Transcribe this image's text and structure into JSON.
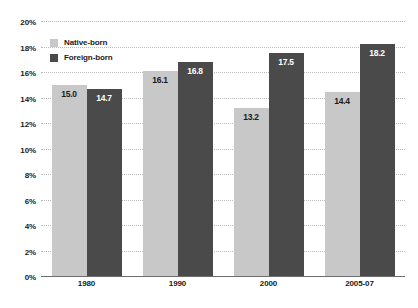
{
  "chart_data": {
    "type": "bar",
    "title": "",
    "xlabel": "",
    "ylabel": "",
    "categories": [
      "1980",
      "1990",
      "2000",
      "2005-07"
    ],
    "series": [
      {
        "name": "Native-born",
        "color": "#c8c8c8",
        "values": [
          15.0,
          16.1,
          13.2,
          14.4
        ],
        "labels": [
          "15.0",
          "16.1",
          "13.2",
          "14.4"
        ]
      },
      {
        "name": "Foreign-born",
        "color": "#4a4a4a",
        "values": [
          14.7,
          16.8,
          17.5,
          18.2
        ],
        "labels": [
          "14.7",
          "16.8",
          "17.5",
          "18.2"
        ]
      }
    ],
    "ylim": [
      0,
      20
    ],
    "ytick_step": 2,
    "ytick_labels": [
      "20%",
      "18%",
      "16%",
      "14%",
      "12%",
      "10%",
      "8%",
      "6%",
      "4%",
      "2%",
      "0%"
    ],
    "ytick_values": [
      20,
      18,
      16,
      14,
      12,
      10,
      8,
      6,
      4,
      2,
      0
    ],
    "grid": true,
    "legend_position": "top-left"
  },
  "legend": {
    "entries": [
      {
        "label": "Native-born"
      },
      {
        "label": "Foreign-born"
      }
    ]
  }
}
